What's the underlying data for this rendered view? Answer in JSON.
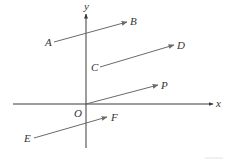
{
  "diagram": {
    "colors": {
      "axis": "#3a3a3a",
      "vector": "#6a6a6a",
      "text": "#333333"
    },
    "axes": {
      "x": {
        "label": "x",
        "from": [
          13,
          104
        ],
        "to": [
          213,
          104
        ],
        "label_pos": [
          216,
          107
        ]
      },
      "y": {
        "label": "y",
        "from": [
          86,
          148
        ],
        "to": [
          86,
          14
        ],
        "label_pos": [
          84,
          10
        ]
      },
      "origin": {
        "label": "O",
        "label_pos": [
          74,
          117
        ]
      }
    },
    "vectors": [
      {
        "name": "AB",
        "start_label": "A",
        "end_label": "B",
        "from": [
          54,
          42
        ],
        "to": [
          127,
          22
        ],
        "start_label_pos": [
          45,
          46
        ],
        "end_label_pos": [
          130,
          25
        ]
      },
      {
        "name": "CD",
        "start_label": "C",
        "end_label": "D",
        "from": [
          100,
          67
        ],
        "to": [
          174,
          45
        ],
        "start_label_pos": [
          91,
          71
        ],
        "end_label_pos": [
          177,
          49
        ]
      },
      {
        "name": "OP",
        "start_label": "",
        "end_label": "P",
        "from": [
          86,
          104
        ],
        "to": [
          158,
          85
        ],
        "start_label_pos": null,
        "end_label_pos": [
          161,
          89
        ]
      },
      {
        "name": "EF",
        "start_label": "E",
        "end_label": "F",
        "from": [
          34,
          138
        ],
        "to": [
          107,
          117
        ],
        "start_label_pos": [
          24,
          142
        ],
        "end_label_pos": [
          111,
          121
        ]
      }
    ]
  }
}
